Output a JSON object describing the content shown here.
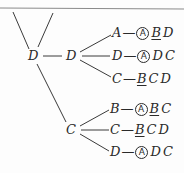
{
  "diagram": {
    "root": {
      "label": "D"
    },
    "level1": [
      {
        "label": "D"
      },
      {
        "label": "C"
      }
    ],
    "rows": [
      {
        "branch": "A",
        "items": [
          {
            "text": "A",
            "circled": true
          },
          {
            "text": "B",
            "underlined": true
          },
          {
            "text": "D"
          }
        ]
      },
      {
        "branch": "D",
        "items": [
          {
            "text": "A",
            "circled": true
          },
          {
            "text": "D"
          },
          {
            "text": "C"
          }
        ]
      },
      {
        "branch": "C",
        "items": [
          {
            "text": "B",
            "underlined": true
          },
          {
            "text": "C"
          },
          {
            "text": "D"
          }
        ]
      },
      {
        "branch": "B",
        "items": [
          {
            "text": "A",
            "circled": true
          },
          {
            "text": "B",
            "underlined": true
          },
          {
            "text": "C"
          }
        ]
      },
      {
        "branch": "C",
        "items": [
          {
            "text": "B",
            "underlined": true
          },
          {
            "text": "C"
          },
          {
            "text": "D"
          }
        ]
      },
      {
        "branch": "D",
        "items": [
          {
            "text": "A",
            "circled": true
          },
          {
            "text": "D"
          },
          {
            "text": "C"
          }
        ]
      }
    ],
    "dash": "—",
    "line_color": "#3a3a3a"
  }
}
